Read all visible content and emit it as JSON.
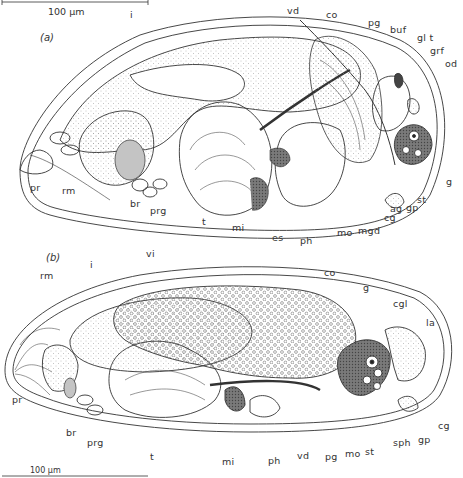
{
  "figure": {
    "scale_bar_top": "100 µm",
    "scale_bar_bottom": "100 µm",
    "colors": {
      "ink": "#333333",
      "stipple": "#9a9a9a",
      "shade": "#c8c8c8",
      "background": "#ffffff"
    },
    "panel_a": {
      "label": "(a)",
      "structures": {
        "i": "i",
        "vd": "vd",
        "co": "co",
        "pg": "pg",
        "buf": "buf",
        "glt": "gl t",
        "grf": "grf",
        "od": "od",
        "pr": "pr",
        "rm": "rm",
        "br": "br",
        "prg": "prg",
        "t": "t",
        "mi": "mi",
        "es": "es",
        "ph": "ph",
        "mo": "mo",
        "mgd": "mgd",
        "cg": "cg",
        "ag": "ag",
        "gp": "gp",
        "st": "st",
        "g": "g"
      }
    },
    "panel_b": {
      "label": "(b)",
      "structures": {
        "rm": "rm",
        "i": "i",
        "vi": "vi",
        "co": "co",
        "g": "g",
        "cgl": "cgl",
        "la": "la",
        "pr": "pr",
        "br": "br",
        "prg": "prg",
        "t": "t",
        "mi": "mi",
        "ph": "ph",
        "vd": "vd",
        "pg": "pg",
        "mo": "mo",
        "st": "st",
        "sph": "sph",
        "gp": "gp",
        "cg": "cg"
      }
    }
  }
}
